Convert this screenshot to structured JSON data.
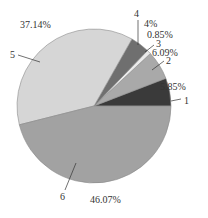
{
  "chart_data": {
    "type": "pie",
    "title": "",
    "categories": [
      "1",
      "2",
      "3",
      "4",
      "5",
      "6"
    ],
    "values": [
      5.85,
      6.09,
      0.85,
      4.0,
      37.14,
      46.07
    ],
    "value_labels": [
      "5.85%",
      "6.09%",
      "0.85%",
      "4%",
      "37.14%",
      "46.07%"
    ],
    "colors": [
      "#3a3a3a",
      "#a9a9a9",
      "#ebebeb",
      "#6f6f6f",
      "#d6d6d6",
      "#a2a2a2"
    ],
    "start_angle_deg": 0,
    "direction": "counterclockwise",
    "legend": "none",
    "caption": ""
  },
  "geometry": {
    "cx": 94,
    "cy": 106,
    "r": 77
  },
  "labels": [
    {
      "cat": "1",
      "cat_xy": [
        184,
        104
      ],
      "val": "5.85%",
      "val_xy": [
        160,
        90
      ],
      "leader": [
        [
          171,
          101
        ],
        [
          181,
          99
        ]
      ]
    },
    {
      "cat": "2",
      "cat_xy": [
        166,
        64
      ],
      "val": "6.09%",
      "val_xy": [
        152,
        56
      ],
      "leader": [
        [
          152,
          70
        ],
        [
          164,
          61
        ]
      ]
    },
    {
      "cat": "3",
      "cat_xy": [
        156,
        47
      ],
      "val": "0.85%",
      "val_xy": [
        147,
        38
      ],
      "leader": [
        [
          145,
          52
        ],
        [
          154,
          45
        ]
      ]
    },
    {
      "cat": "4",
      "cat_xy": [
        134,
        17
      ],
      "val": "4%",
      "val_xy": [
        144,
        27
      ],
      "leader": [
        [
          138,
          45
        ],
        [
          138,
          20
        ]
      ]
    },
    {
      "cat": "5",
      "cat_xy": [
        10,
        58
      ],
      "val": "37.14%",
      "val_xy": [
        20,
        28
      ],
      "leader": [
        [
          18,
          55
        ],
        [
          40,
          62
        ]
      ]
    },
    {
      "cat": "6",
      "cat_xy": [
        60,
        200
      ],
      "val": "46.07%",
      "val_xy": [
        90,
        203
      ],
      "leader": [
        [
          65,
          190
        ],
        [
          76,
          163
        ]
      ]
    }
  ]
}
